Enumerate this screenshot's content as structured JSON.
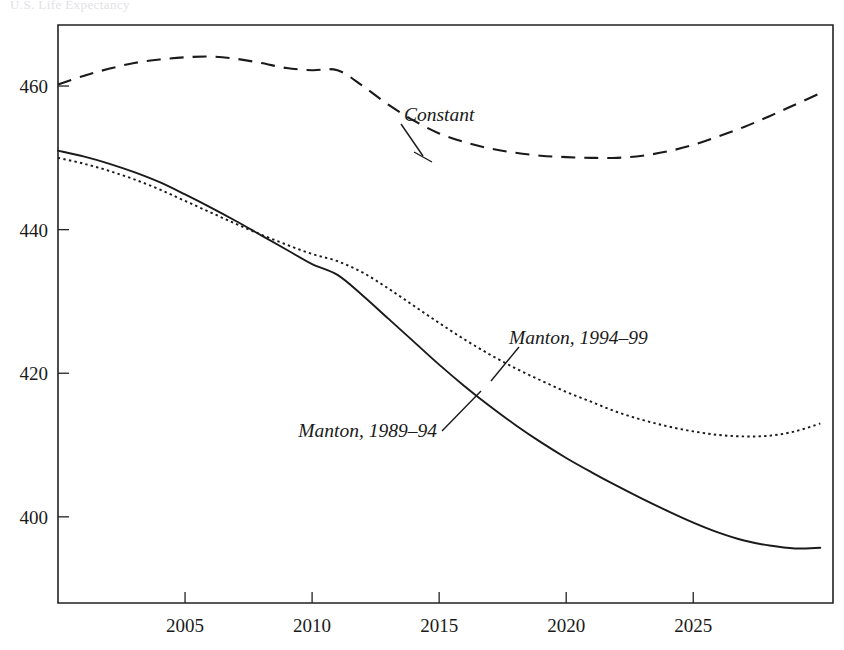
{
  "figure": {
    "cut_off_title": "U.S. Life Expectancy",
    "width": 844,
    "height": 650
  },
  "chart_data": {
    "type": "line",
    "title": "",
    "subtitle": "",
    "xlabel": "",
    "ylabel": "",
    "xlim": [
      2000,
      2030.5
    ],
    "ylim": [
      388,
      468.5
    ],
    "xticks": [
      2005,
      2010,
      2015,
      2020,
      2025
    ],
    "xtick_labels": [
      "2005",
      "2010",
      "2015",
      "2020",
      "2025"
    ],
    "yticks": [
      400,
      420,
      440,
      460
    ],
    "ytick_labels": [
      "400",
      "420",
      "440",
      "460"
    ],
    "grid": false,
    "legend_position": "inline-annotations",
    "frame": "box",
    "series": [
      {
        "name": "Constant",
        "style": "dashed",
        "label": "Constant",
        "x": [
          2000,
          2001,
          2002,
          2003,
          2004,
          2005,
          2006,
          2007,
          2008,
          2009,
          2010,
          2011,
          2012,
          2013,
          2014,
          2015,
          2016,
          2017,
          2018,
          2019,
          2020,
          2021,
          2022,
          2023,
          2024,
          2025,
          2026,
          2027,
          2028,
          2029,
          2030
        ],
        "values": [
          460.2,
          461.4,
          462.4,
          463.2,
          463.7,
          464.0,
          464.1,
          463.8,
          463.2,
          462.5,
          462.2,
          462.2,
          460.0,
          457.4,
          455.2,
          453.4,
          452.2,
          451.3,
          450.7,
          450.3,
          450.1,
          450.0,
          450.0,
          450.3,
          450.9,
          451.8,
          453.0,
          454.3,
          455.8,
          457.4,
          459.0
        ]
      },
      {
        "name": "Manton, 1994-99",
        "style": "dotted",
        "label": "Manton, 1994–99",
        "x": [
          2000,
          2001,
          2002,
          2003,
          2004,
          2005,
          2006,
          2007,
          2008,
          2009,
          2010,
          2011,
          2012,
          2013,
          2014,
          2015,
          2016,
          2017,
          2018,
          2019,
          2020,
          2021,
          2022,
          2023,
          2024,
          2025,
          2026,
          2027,
          2028,
          2029,
          2030
        ],
        "values": [
          450.0,
          449.2,
          448.2,
          447.0,
          445.6,
          444.0,
          442.4,
          440.8,
          439.3,
          437.9,
          436.6,
          435.6,
          434.0,
          431.8,
          429.4,
          427.0,
          424.7,
          422.6,
          420.7,
          419.0,
          417.4,
          416.0,
          414.6,
          413.5,
          412.6,
          411.9,
          411.4,
          411.2,
          411.3,
          411.9,
          413.0
        ]
      },
      {
        "name": "Manton, 1989-94",
        "style": "solid",
        "label": "Manton, 1989–94",
        "x": [
          2000,
          2001,
          2002,
          2003,
          2004,
          2005,
          2006,
          2007,
          2008,
          2009,
          2010,
          2011,
          2012,
          2013,
          2014,
          2015,
          2016,
          2017,
          2018,
          2019,
          2020,
          2021,
          2022,
          2023,
          2024,
          2025,
          2026,
          2027,
          2028,
          2029,
          2030
        ],
        "values": [
          451.0,
          450.2,
          449.2,
          448.0,
          446.6,
          444.9,
          443.1,
          441.2,
          439.2,
          437.2,
          435.2,
          433.7,
          430.8,
          427.6,
          424.4,
          421.2,
          418.2,
          415.4,
          412.8,
          410.4,
          408.2,
          406.2,
          404.3,
          402.5,
          400.8,
          399.2,
          397.8,
          396.7,
          396.0,
          395.6,
          395.7
        ]
      }
    ],
    "annotations": [
      {
        "text": "Constant",
        "series": "Constant",
        "x": 1.0,
        "y": 1.0
      },
      {
        "text": "Manton, 1994–99",
        "series": "Manton, 1994-99",
        "x": 1.0,
        "y": 1.0
      },
      {
        "text": "Manton, 1989–94",
        "series": "Manton, 1989-94",
        "x": 1.0,
        "y": 1.0
      }
    ]
  }
}
